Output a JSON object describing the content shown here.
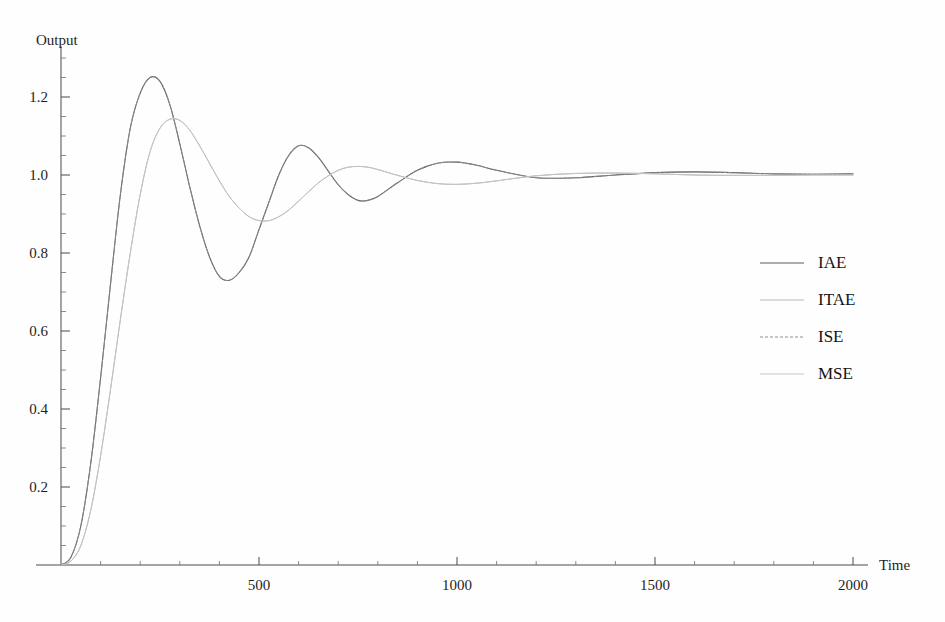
{
  "figure": {
    "background_color": "#fefefe",
    "width": 945,
    "height": 622
  },
  "axes": {
    "y_title": "Output",
    "x_title": "Time",
    "x_tick_labels": [
      "500",
      "1000",
      "1500",
      "2000"
    ],
    "y_tick_labels": [
      "0.2",
      "0.4",
      "0.6",
      "0.8",
      "1.0",
      "1.2"
    ]
  },
  "legend": {
    "entries": [
      {
        "label": "IAE",
        "color": "#5b5b5b",
        "dash": "none",
        "width": 1.1
      },
      {
        "label": "ITAE",
        "color": "#b9b9b9",
        "dash": "none",
        "width": 1.0
      },
      {
        "label": "ISE",
        "color": "#8f8f8f",
        "dash": "3,2",
        "width": 1.0
      },
      {
        "label": "MSE",
        "color": "#c4c4c4",
        "dash": "none",
        "width": 1.0
      }
    ]
  },
  "chart_data": {
    "type": "line",
    "title": "",
    "subtitle": "",
    "xlabel": "Time",
    "ylabel": "Output",
    "xlim": [
      0,
      2060
    ],
    "ylim": [
      0,
      1.33
    ],
    "x_ticks_major": [
      500,
      1000,
      1500,
      2000
    ],
    "x_ticks_minor": [
      100,
      200,
      300,
      400,
      600,
      700,
      800,
      900,
      1100,
      1200,
      1300,
      1400,
      1600,
      1700,
      1800,
      1900
    ],
    "y_ticks_major": [
      0.2,
      0.4,
      0.6,
      0.8,
      1.0,
      1.2
    ],
    "y_ticks_minor": [
      0.05,
      0.1,
      0.15,
      0.25,
      0.3,
      0.35,
      0.45,
      0.5,
      0.55,
      0.65,
      0.7,
      0.75,
      0.85,
      0.9,
      0.95,
      1.05,
      1.1,
      1.15,
      1.25,
      1.3
    ],
    "grid": false,
    "legend_position": "center-right",
    "x": [
      0,
      25,
      50,
      75,
      100,
      125,
      150,
      175,
      200,
      225,
      250,
      275,
      300,
      325,
      350,
      375,
      400,
      425,
      450,
      475,
      500,
      525,
      550,
      575,
      600,
      625,
      650,
      675,
      700,
      725,
      750,
      775,
      800,
      850,
      900,
      950,
      1000,
      1050,
      1100,
      1200,
      1300,
      1400,
      1500,
      1600,
      1700,
      1800,
      1900,
      2000
    ],
    "series": [
      {
        "name": "IAE",
        "color": "#5b5b5b",
        "dash": "none",
        "values": [
          0.0,
          0.02,
          0.1,
          0.26,
          0.48,
          0.72,
          0.95,
          1.12,
          1.21,
          1.25,
          1.24,
          1.18,
          1.08,
          0.97,
          0.87,
          0.79,
          0.74,
          0.73,
          0.75,
          0.79,
          0.86,
          0.93,
          1.0,
          1.05,
          1.075,
          1.07,
          1.045,
          1.01,
          0.975,
          0.95,
          0.935,
          0.935,
          0.945,
          0.98,
          1.012,
          1.03,
          1.033,
          1.025,
          1.012,
          0.993,
          0.993,
          1.0,
          1.006,
          1.008,
          1.006,
          1.003,
          1.002,
          1.003
        ]
      },
      {
        "name": "ITAE",
        "color": "#b9b9b9",
        "dash": "none",
        "values": [
          0.0,
          0.01,
          0.05,
          0.14,
          0.28,
          0.45,
          0.63,
          0.8,
          0.95,
          1.06,
          1.12,
          1.143,
          1.14,
          1.115,
          1.075,
          1.03,
          0.985,
          0.945,
          0.915,
          0.893,
          0.883,
          0.883,
          0.893,
          0.91,
          0.933,
          0.957,
          0.98,
          0.998,
          1.012,
          1.02,
          1.022,
          1.02,
          1.014,
          0.999,
          0.986,
          0.978,
          0.976,
          0.979,
          0.985,
          0.998,
          1.004,
          1.005,
          1.003,
          1.0,
          0.999,
          0.999,
          1.0,
          1.0
        ]
      },
      {
        "name": "ISE",
        "color": "#8f8f8f",
        "dash": "3,2",
        "values": [
          0.0,
          0.02,
          0.1,
          0.26,
          0.48,
          0.72,
          0.95,
          1.12,
          1.21,
          1.25,
          1.24,
          1.18,
          1.08,
          0.97,
          0.87,
          0.79,
          0.74,
          0.73,
          0.75,
          0.79,
          0.86,
          0.93,
          1.0,
          1.05,
          1.075,
          1.07,
          1.045,
          1.01,
          0.975,
          0.95,
          0.935,
          0.935,
          0.945,
          0.98,
          1.012,
          1.03,
          1.033,
          1.025,
          1.012,
          0.993,
          0.993,
          1.0,
          1.006,
          1.008,
          1.006,
          1.003,
          1.002,
          1.003
        ]
      },
      {
        "name": "MSE",
        "color": "#c4c4c4",
        "dash": "none",
        "values": [
          0.0,
          0.01,
          0.05,
          0.14,
          0.28,
          0.45,
          0.63,
          0.8,
          0.95,
          1.06,
          1.12,
          1.143,
          1.14,
          1.115,
          1.075,
          1.03,
          0.985,
          0.945,
          0.915,
          0.893,
          0.883,
          0.883,
          0.893,
          0.91,
          0.933,
          0.957,
          0.98,
          0.998,
          1.012,
          1.02,
          1.022,
          1.02,
          1.014,
          0.999,
          0.986,
          0.978,
          0.976,
          0.979,
          0.985,
          0.998,
          1.004,
          1.005,
          1.003,
          1.0,
          0.999,
          0.999,
          1.0,
          1.0
        ]
      }
    ]
  }
}
